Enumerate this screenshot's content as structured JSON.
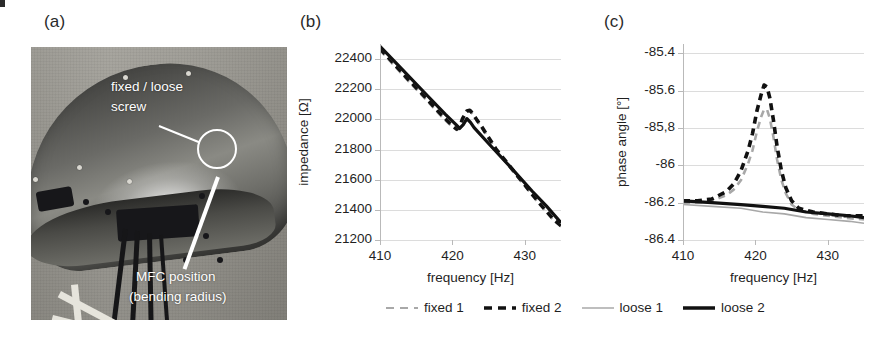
{
  "figure": {
    "panels": [
      {
        "id": "a",
        "label": "(a)"
      },
      {
        "id": "b",
        "label": "(b)"
      },
      {
        "id": "c",
        "label": "(c)"
      }
    ]
  },
  "photo": {
    "alt_name": "curved-composite-demonstrator-photo",
    "annotations": [
      {
        "name": "fixed-loose-screw",
        "line1": "fixed / loose",
        "line2": "screw"
      },
      {
        "name": "mfc-position",
        "line1": "MFC position",
        "line2": "(bending radius)"
      }
    ]
  },
  "legend": {
    "items": [
      {
        "label": "fixed 1",
        "style": "dashed",
        "color": "#a8a8a8",
        "width": 2
      },
      {
        "label": "fixed 2",
        "style": "dashed",
        "color": "#111111",
        "width": 3.5
      },
      {
        "label": "loose 1",
        "style": "solid",
        "color": "#a8a8a8",
        "width": 1.5
      },
      {
        "label": "loose 2",
        "style": "solid",
        "color": "#111111",
        "width": 3.5
      }
    ]
  },
  "chart_data": [
    {
      "id": "b",
      "type": "line",
      "title": "",
      "xlabel": "frequency [Hz]",
      "ylabel": "impedance [Ω]",
      "xlim": [
        410,
        435
      ],
      "ylim": [
        21200,
        22500
      ],
      "xticks": [
        410,
        420,
        430
      ],
      "yticks": [
        21200,
        21400,
        21600,
        21800,
        22000,
        22200,
        22400
      ],
      "xticklabels": [
        "410",
        "420",
        "430"
      ],
      "yticklabels": [
        "21200",
        "21400",
        "21600",
        "21800",
        "22000",
        "22200",
        "22400"
      ],
      "grid": true,
      "legend_position": "below-figure",
      "series": [
        {
          "name": "fixed 1",
          "color": "#a8a8a8",
          "style": "dashed",
          "x": [
            410,
            412,
            414,
            416,
            418,
            419,
            420,
            420.6,
            421,
            421.4,
            422,
            422.4,
            422.8,
            423.4,
            424,
            426,
            428,
            430,
            432,
            434,
            435
          ],
          "y": [
            22460,
            22355,
            22250,
            22150,
            22045,
            21995,
            21950,
            21930,
            21945,
            22000,
            22050,
            22055,
            22035,
            21990,
            21950,
            21800,
            21680,
            21560,
            21440,
            21330,
            21290
          ]
        },
        {
          "name": "fixed 2",
          "color": "#111111",
          "style": "dashed",
          "x": [
            410,
            412,
            414,
            416,
            418,
            419,
            420,
            420.6,
            421,
            421.4,
            422,
            422.4,
            422.8,
            423.4,
            424,
            426,
            428,
            430,
            432,
            434,
            435
          ],
          "y": [
            22470,
            22365,
            22260,
            22160,
            22055,
            22005,
            21958,
            21935,
            21950,
            22005,
            22055,
            22060,
            22040,
            21995,
            21955,
            21805,
            21685,
            21565,
            21445,
            21335,
            21295
          ]
        },
        {
          "name": "loose 1",
          "color": "#a8a8a8",
          "style": "solid",
          "x": [
            410,
            413,
            416,
            419,
            420.5,
            421,
            421.5,
            422,
            422.5,
            423,
            425,
            428,
            431,
            433,
            435
          ],
          "y": [
            22480,
            22330,
            22180,
            22030,
            21960,
            21935,
            21960,
            22000,
            21975,
            21940,
            21835,
            21680,
            21520,
            21420,
            21310
          ]
        },
        {
          "name": "loose 2",
          "color": "#111111",
          "style": "solid",
          "x": [
            410,
            413,
            416,
            419,
            420.5,
            421,
            421.5,
            422,
            422.5,
            423,
            425,
            428,
            431,
            433,
            435
          ],
          "y": [
            22485,
            22335,
            22185,
            22035,
            21965,
            21940,
            21965,
            22005,
            21980,
            21945,
            21840,
            21685,
            21525,
            21425,
            21315
          ]
        }
      ]
    },
    {
      "id": "c",
      "type": "line",
      "title": "",
      "xlabel": "frequency [Hz]",
      "ylabel": "phase angle [°]",
      "xlim": [
        410,
        435
      ],
      "ylim": [
        -86.4,
        -85.35
      ],
      "xticks": [
        410,
        420,
        430
      ],
      "yticks": [
        -86.4,
        -86.2,
        -86.0,
        -85.8,
        -85.6,
        -85.4
      ],
      "xticklabels": [
        "410",
        "420",
        "430"
      ],
      "yticklabels": [
        "-86.4",
        "-86.2",
        "-86",
        "-85,8",
        "-85.6",
        "-85.4"
      ],
      "grid": true,
      "legend_position": "below-figure",
      "series": [
        {
          "name": "fixed 1",
          "color": "#a8a8a8",
          "style": "dashed",
          "x": [
            410,
            412,
            414,
            416,
            417,
            418,
            419,
            419.6,
            420.2,
            420.8,
            421.2,
            421.6,
            422,
            422.5,
            423,
            423.6,
            424.2,
            425,
            426,
            428,
            430,
            432,
            435
          ],
          "y": [
            -86.2,
            -86.2,
            -86.19,
            -86.16,
            -86.13,
            -86.08,
            -85.99,
            -85.92,
            -85.82,
            -85.74,
            -85.7,
            -85.7,
            -85.75,
            -85.85,
            -85.97,
            -86.08,
            -86.15,
            -86.21,
            -86.24,
            -86.26,
            -86.27,
            -86.28,
            -86.29
          ]
        },
        {
          "name": "fixed 2",
          "color": "#111111",
          "style": "dashed",
          "x": [
            410,
            412,
            414,
            416,
            417,
            418,
            419,
            419.6,
            420.2,
            420.8,
            421.2,
            421.6,
            422,
            422.5,
            423,
            423.6,
            424.2,
            425,
            426,
            428,
            430,
            432,
            435
          ],
          "y": [
            -86.19,
            -86.19,
            -86.18,
            -86.14,
            -86.1,
            -86.03,
            -85.92,
            -85.83,
            -85.71,
            -85.62,
            -85.57,
            -85.58,
            -85.64,
            -85.76,
            -85.9,
            -86.03,
            -86.12,
            -86.19,
            -86.23,
            -86.25,
            -86.26,
            -86.27,
            -86.27
          ]
        },
        {
          "name": "loose 1",
          "color": "#a8a8a8",
          "style": "solid",
          "x": [
            410,
            414,
            418,
            421,
            424,
            427,
            430,
            433,
            435
          ],
          "y": [
            -86.21,
            -86.22,
            -86.23,
            -86.25,
            -86.26,
            -86.28,
            -86.29,
            -86.3,
            -86.31
          ]
        },
        {
          "name": "loose 2",
          "color": "#111111",
          "style": "solid",
          "x": [
            410,
            414,
            418,
            421,
            424,
            427,
            430,
            433,
            435
          ],
          "y": [
            -86.19,
            -86.2,
            -86.21,
            -86.22,
            -86.23,
            -86.25,
            -86.26,
            -86.27,
            -86.28
          ]
        }
      ]
    }
  ]
}
